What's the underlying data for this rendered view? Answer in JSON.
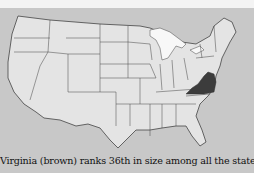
{
  "map": {
    "subject": "Contiguous United States",
    "highlighted_state": "Virginia",
    "colors": {
      "background": "#c8c8c8",
      "land": "#e4e4e4",
      "borders": "#444444",
      "highlight": "#3c3c3c",
      "water": "#f8f8f8"
    }
  },
  "caption": {
    "text": "Virginia (brown) ranks 36th in size among all the states and"
  }
}
